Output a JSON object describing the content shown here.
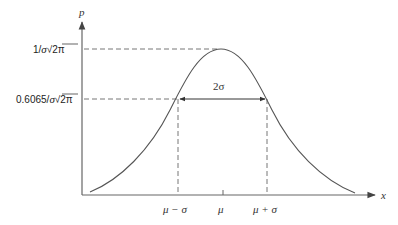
{
  "figure": {
    "type": "normal-distribution-diagram",
    "y_axis_label": "p",
    "x_axis_label": "x",
    "y_levels": [
      {
        "label_prefix": "1/",
        "label_sigma": "σ",
        "label_root": "√",
        "label_radicand": "2π",
        "full": "1/σ√2π"
      },
      {
        "label_prefix": "0.6065/",
        "label_sigma": "σ",
        "label_root": "√",
        "label_radicand": "2π",
        "full": "0.6065/σ√2π"
      }
    ],
    "x_ticks": [
      {
        "label": "μ − σ"
      },
      {
        "label": "μ"
      },
      {
        "label": "μ + σ"
      }
    ],
    "width_annotation": "2σ",
    "colors": {
      "axis": "#555555",
      "curve": "#555555",
      "dashed": "#666666",
      "text": "#222222"
    }
  }
}
